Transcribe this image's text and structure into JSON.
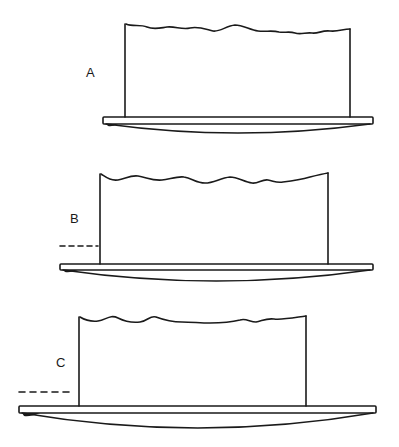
{
  "figure": {
    "panels": [
      {
        "id": "A",
        "label": "A",
        "label_pos": [
          86,
          66
        ],
        "has_dashed_line": false,
        "wall": {
          "left_x": 125,
          "right_x": 350,
          "top_left_y": 24,
          "top_right_y": 29,
          "bottom_y": 117
        },
        "plate": {
          "left_x": 103,
          "right_x": 373,
          "top_y": 117,
          "bottom_y": 124
        },
        "lens": {
          "left_x": 106,
          "right_x": 370,
          "top_y": 124,
          "bottom_y": 133
        }
      },
      {
        "id": "B",
        "label": "B",
        "label_pos": [
          71,
          212
        ],
        "has_dashed_line": true,
        "dashed_line": {
          "x1": 60,
          "x2": 98,
          "y": 246
        },
        "wall": {
          "left_x": 100,
          "right_x": 327,
          "top_left_y": 174,
          "top_right_y": 173,
          "bottom_y": 264
        },
        "plate": {
          "left_x": 60,
          "right_x": 373,
          "top_y": 264,
          "bottom_y": 270
        },
        "lens": {
          "left_x": 63,
          "right_x": 370,
          "top_y": 270,
          "bottom_y": 281
        }
      },
      {
        "id": "C",
        "label": "C",
        "label_pos": [
          56,
          356
        ],
        "has_dashed_line": true,
        "dashed_line": {
          "x1": 19,
          "x2": 74,
          "y": 392
        },
        "wall": {
          "left_x": 79,
          "right_x": 305,
          "top_left_y": 317,
          "top_right_y": 316,
          "bottom_y": 406
        },
        "plate": {
          "left_x": 19,
          "right_x": 376,
          "top_y": 406,
          "bottom_y": 413
        },
        "lens": {
          "left_x": 22,
          "right_x": 373,
          "top_y": 413,
          "bottom_y": 428
        }
      }
    ],
    "colors": {
      "ink": "#1a1a1a",
      "background": "#ffffff"
    }
  }
}
